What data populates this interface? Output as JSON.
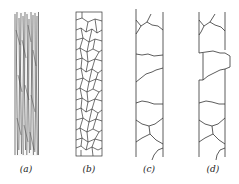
{
  "figure": {
    "stroke_color": "#333333",
    "background": "#ffffff",
    "panels": [
      {
        "id": "a",
        "label": "(a)",
        "style": "fibrous longitudinal streaks",
        "label_x": 11
      },
      {
        "id": "b",
        "label": "(b)",
        "style": "equiaxed polygonal grains",
        "label_x": 74
      },
      {
        "id": "c",
        "label": "(c)",
        "style": "straight strip with transverse cracks",
        "label_x": 134
      },
      {
        "id": "d",
        "label": "(d)",
        "style": "strip with stepped offset and transverse cracks",
        "label_x": 198
      }
    ]
  }
}
